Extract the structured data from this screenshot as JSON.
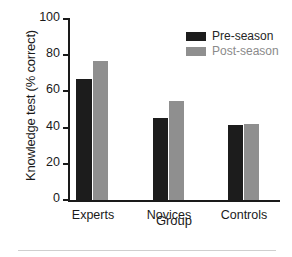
{
  "chart_data": {
    "type": "bar",
    "title": "",
    "xlabel": "Group",
    "ylabel": "Knowledge test (% correct)",
    "categories": [
      "Experts",
      "Novices",
      "Controls"
    ],
    "series": [
      {
        "name": "Pre-season",
        "color": "#1c1c1c",
        "values": [
          66.5,
          45.0,
          41.5
        ]
      },
      {
        "name": "Post-season",
        "color": "#8f8f8f",
        "values": [
          76.5,
          54.5,
          42.0
        ]
      }
    ],
    "ylim": [
      0,
      100
    ],
    "yticks": [
      0,
      20,
      40,
      60,
      80,
      100
    ],
    "ytick_labels": [
      "0",
      "20",
      "40",
      "60",
      "80",
      "100"
    ],
    "grid": false,
    "legend_position": "top-right"
  },
  "legend": {
    "items": [
      {
        "label": "Pre-season",
        "color": "#1c1c1c"
      },
      {
        "label": "Post-season",
        "color": "#8f8f8f"
      }
    ]
  },
  "axes": {
    "y_title": "Knowledge test (% correct)",
    "x_title": "Group"
  }
}
